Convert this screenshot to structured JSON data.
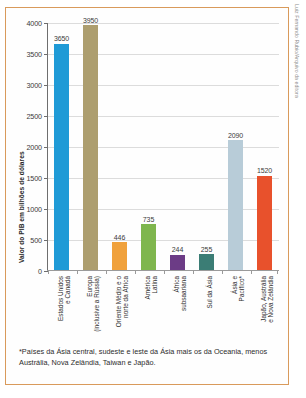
{
  "credit": "Luiz Fernando Rubio/Arquivo da editora",
  "footnote": "*Países da Ásia central, sudeste e leste da Ásia mais os da Oceania, menos Austrália, Nova Zelândia, Taiwan e Japão.",
  "chart_data": {
    "type": "bar",
    "title": "",
    "xlabel": "",
    "ylabel": "Valor do PIB em bilhões de dólares",
    "ylim": [
      0,
      4000
    ],
    "ytick_labels": [
      "0",
      "500",
      "1000",
      "1500",
      "2000",
      "2500",
      "3000",
      "3500",
      "4000"
    ],
    "ytick_values": [
      0,
      500,
      1000,
      1500,
      2000,
      2500,
      3000,
      3500,
      4000
    ],
    "grid": true,
    "legend": "none",
    "categories": [
      "Estados Unidos\ne Canadá",
      "Europa\n(inclusive a Rússia)",
      "Oriente Médio e o\nnorte da África",
      "América\nLatina",
      "África\nsubsaariana",
      "Sul da Ásia",
      "Ásia e\nPacífico*",
      "Japão, Austrália\ne Nova Zelândia"
    ],
    "values": [
      3650,
      3950,
      446,
      735,
      244,
      255,
      2090,
      1520
    ],
    "value_labels": [
      "3650",
      "3950",
      "446",
      "735",
      "244",
      "255",
      "2090",
      "1520"
    ],
    "colors": [
      "#1f9ad6",
      "#ad9e6f",
      "#f0a13c",
      "#7fb64e",
      "#6c3c86",
      "#3b7d75",
      "#b8ccd8",
      "#e8512c"
    ]
  }
}
